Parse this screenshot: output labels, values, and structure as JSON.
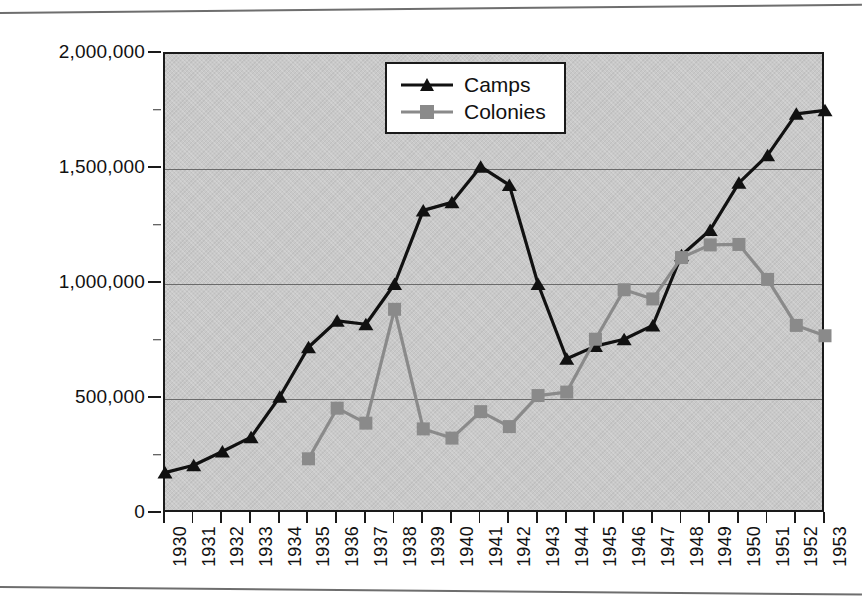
{
  "chart_data": {
    "type": "line",
    "title": "",
    "subtitle": "",
    "xlabel": "",
    "ylabel": "",
    "categories": [
      "1930",
      "1931",
      "1932",
      "1933",
      "1934",
      "1935",
      "1936",
      "1937",
      "1938",
      "1939",
      "1940",
      "1941",
      "1942",
      "1943",
      "1944",
      "1945",
      "1946",
      "1947",
      "1948",
      "1949",
      "1950",
      "1951",
      "1952",
      "1953"
    ],
    "ylim": [
      0,
      2000000
    ],
    "ytick_labels": [
      "0",
      "500,000",
      "1,000,000",
      "1,500,000",
      "2,000,000"
    ],
    "ytick_values": [
      0,
      500000,
      1000000,
      1500000,
      2000000
    ],
    "ytick_minor_values": [
      250000,
      750000,
      1250000,
      1750000
    ],
    "grid": "horizontal",
    "legend_position": "top-center",
    "series": [
      {
        "name": "Camps",
        "color": "#111111",
        "marker": "triangle",
        "values": [
          180000,
          212000,
          272000,
          334000,
          510000,
          725000,
          840000,
          825000,
          1000000,
          1320000,
          1355000,
          1510000,
          1430000,
          1000000,
          675000,
          730000,
          760000,
          820000,
          1125000,
          1235000,
          1440000,
          1560000,
          1740000,
          1755000
        ]
      },
      {
        "name": "Colonies",
        "color": "#8a8a8a",
        "marker": "square",
        "values": [
          null,
          null,
          null,
          null,
          null,
          240000,
          460000,
          395000,
          890000,
          370000,
          330000,
          445000,
          380000,
          515000,
          530000,
          760000,
          975000,
          935000,
          1115000,
          1170000,
          1172000,
          1020000,
          820000,
          775000
        ]
      }
    ]
  },
  "legend": {
    "items": [
      {
        "label": "Camps"
      },
      {
        "label": "Colonies"
      }
    ]
  },
  "colors": {
    "plot_background": "#c9c9c9",
    "axis": "#1a1a1a",
    "gridline": "#5a5a5a",
    "camps": "#111111",
    "colonies": "#8a8a8a",
    "page_background": "#ffffff"
  }
}
